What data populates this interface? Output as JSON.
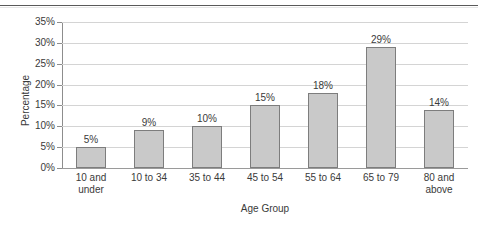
{
  "chart_data": {
    "type": "bar",
    "title": "",
    "xlabel": "Age Group",
    "ylabel": "Percentage",
    "categories": [
      "10 and under",
      "10 to 34",
      "35 to 44",
      "45 to 54",
      "55 to 64",
      "65 to 79",
      "80 and above"
    ],
    "category_lines": [
      [
        "10 and",
        "under"
      ],
      [
        "10 to 34",
        ""
      ],
      [
        "35 to 44",
        ""
      ],
      [
        "45 to 54",
        ""
      ],
      [
        "55 to 64",
        ""
      ],
      [
        "65 to 79",
        ""
      ],
      [
        "80 and",
        "above"
      ]
    ],
    "values": [
      5,
      9,
      10,
      15,
      18,
      29,
      14
    ],
    "data_labels": [
      "5%",
      "9%",
      "10%",
      "15%",
      "18%",
      "29%",
      "14%"
    ],
    "ylim": [
      0,
      35
    ],
    "ytick_values": [
      0,
      5,
      10,
      15,
      20,
      25,
      30,
      35
    ],
    "ytick_labels": [
      "0%",
      "5%",
      "10%",
      "15%",
      "20%",
      "25%",
      "30%",
      "35%"
    ],
    "grid": true,
    "legend": false,
    "bar_fill_color": "#c9c9c9",
    "bar_border_color": "#7d7d7d",
    "gridline_color": "#d4d4d4",
    "axis_color": "#8d8d8d",
    "text_color": "#3a3a3a",
    "background_color": "#ffffff"
  }
}
